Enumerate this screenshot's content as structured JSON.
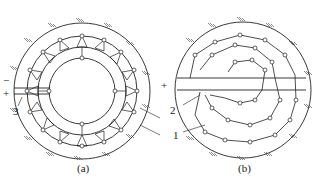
{
  "figure": {
    "panels": [
      {
        "id": "a",
        "caption": "(a)",
        "description": "ring-shaped zigzag electrode layout in circular pit"
      },
      {
        "id": "b",
        "caption": "(b)",
        "description": "spiral electrode layout in circular pit"
      }
    ],
    "labels": {
      "minus": "−",
      "plus": "+",
      "a_3": "3",
      "a_2": "2",
      "a_1": "1",
      "b_minus": "−",
      "b_plus": "+",
      "b_2": "2",
      "b_1": "1"
    },
    "colors": {
      "line": "#222222",
      "background": "#ffffff"
    }
  }
}
